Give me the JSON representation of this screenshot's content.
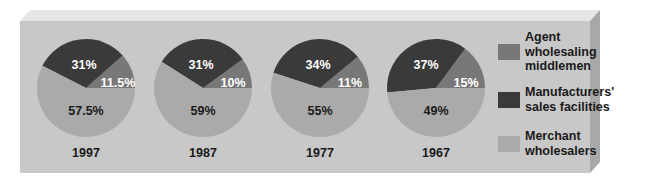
{
  "chart_data": {
    "type": "pie",
    "title": "",
    "legend_position": "right",
    "series_order": [
      "Agent wholesaling middlemen",
      "Manufacturers' sales facilities",
      "Merchant wholesalers"
    ],
    "legend": [
      {
        "label": "Agent\nwholesaling\nmiddlemen",
        "name": "Agent wholesaling middlemen",
        "color": "#787878"
      },
      {
        "label": "Manufacturers'\nsales facilities",
        "name": "Manufacturers' sales facilities",
        "color": "#3a3a3a"
      },
      {
        "label": "Merchant\nwholesalers",
        "name": "Merchant wholesalers",
        "color": "#aaaaaa"
      }
    ],
    "pies": [
      {
        "year": "1997",
        "values": [
          11.5,
          31,
          57.5
        ],
        "labels": [
          "11.5%",
          "31%",
          "57.5%"
        ]
      },
      {
        "year": "1987",
        "values": [
          10,
          31,
          59
        ],
        "labels": [
          "10%",
          "31%",
          "59%"
        ]
      },
      {
        "year": "1977",
        "values": [
          11,
          34,
          55
        ],
        "labels": [
          "11%",
          "34%",
          "55%"
        ]
      },
      {
        "year": "1967",
        "values": [
          15,
          37,
          49
        ],
        "labels": [
          "15%",
          "37%",
          "49%"
        ]
      }
    ]
  },
  "colors": {
    "panel_front": "#c8c8c8",
    "panel_top": "#e6e6e6",
    "panel_side": "#a8a8a8",
    "label_light": "#ffffff",
    "label_dark": "#1a1a1a"
  }
}
